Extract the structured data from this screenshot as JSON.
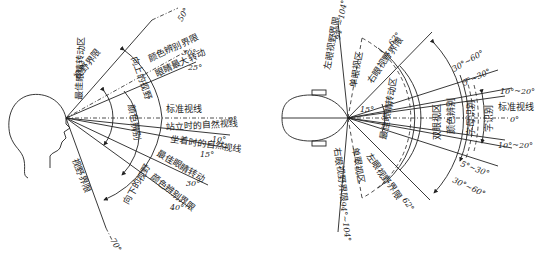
{
  "vertical": {
    "labels": {
      "field_limit_upper": "视野界限",
      "field_limit_lower": "视野界限",
      "color_limit_upper": "颜色辨别界限",
      "eye_max_rotation": "眼睛最大转动",
      "upward_view": "向上的视野",
      "best_eye_zone": "最佳眼睛转动区",
      "color_zone": "颜色辨别",
      "standard_sightline": "标准视线",
      "standing_sightline": "站立时的自然视线",
      "sitting_sightline": "坐着时的自然视线",
      "downward_view": "向下的视野",
      "best_eye_rotation": "最佳眼睛转动",
      "color_limit_lower": "颜色辨别界限"
    },
    "angles": {
      "up50": "50°",
      "up30": "30°",
      "up25": "25°",
      "zero": "0°",
      "d10": "10°",
      "d15": "15°",
      "d30": "30°",
      "d40": "40°",
      "d70": "70°"
    }
  },
  "horizontal": {
    "labels": {
      "left_eye_limit": "左眼视野界限",
      "right_eye_limit_top": "右眼视野界限",
      "mono_top": "单眼视区",
      "mono_bottom": "单眼视区",
      "right_eye_limit_bottom": "右眼视野界限",
      "left_eye_limit_bottom": "左眼视野界限",
      "best_eye_zone": "最佳眼睛转动区",
      "binocular": "双眼视区",
      "color": "颜色辨别",
      "word": "字母识别",
      "char": "字识别",
      "standard_sightline": "标准视线"
    },
    "angles": {
      "a94_104": "94°~104°",
      "a62": "62°",
      "a30_60": "30°~60°",
      "a5_30": "5°~30°",
      "a10_20": "10°~20°",
      "zero": "0°",
      "a15": "15°",
      "b10_20": "10°~20°",
      "b5_30": "5°~30°",
      "b30_60": "30°~60°",
      "b62": "62°",
      "b94_104": "94°~104°"
    }
  }
}
